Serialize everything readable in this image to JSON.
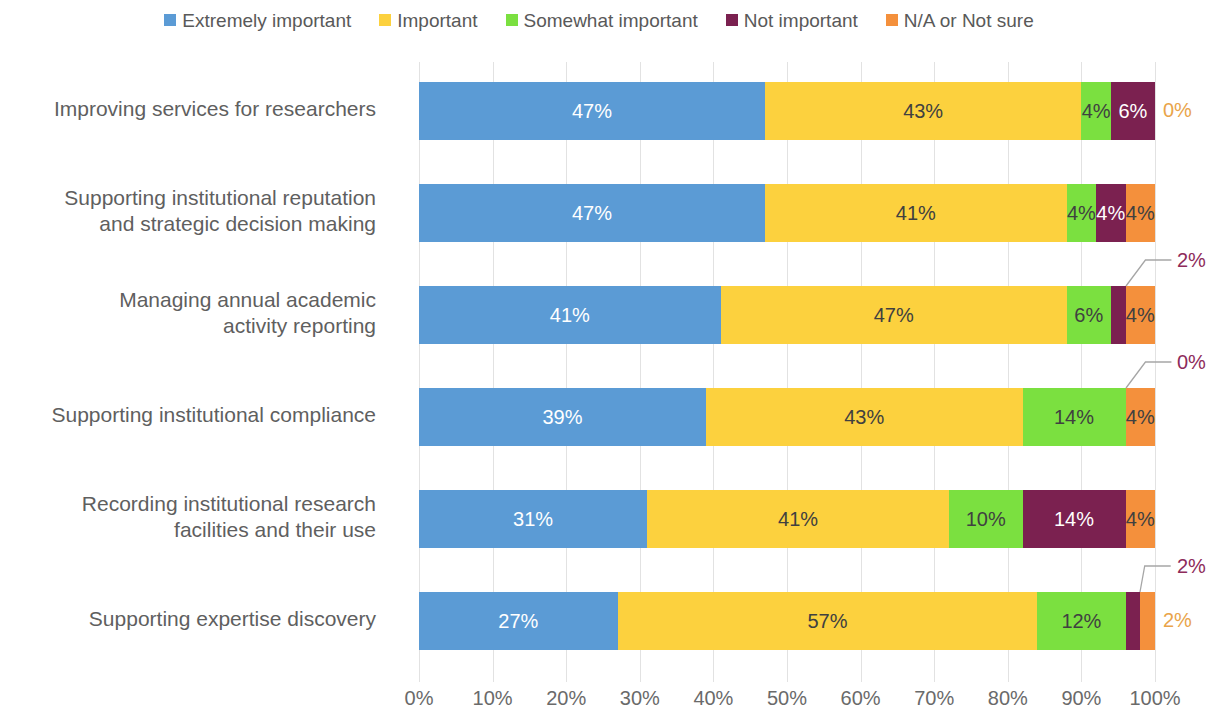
{
  "legend": {
    "items": [
      {
        "label": "Extremely important",
        "color": "#5B9BD5"
      },
      {
        "label": "Important",
        "color": "#FCD13E"
      },
      {
        "label": "Somewhat important",
        "color": "#7BE040"
      },
      {
        "label": "Not important",
        "color": "#7B2150"
      },
      {
        "label": "N/A or Not sure",
        "color": "#F4903C"
      }
    ]
  },
  "axis": {
    "ticks": [
      "0%",
      "10%",
      "20%",
      "30%",
      "40%",
      "50%",
      "60%",
      "70%",
      "80%",
      "90%",
      "100%"
    ]
  },
  "rows": [
    {
      "label_lines": [
        "Improving services for researchers"
      ],
      "segments": [
        {
          "value": 47,
          "label": "47%",
          "inside": true,
          "text_color": "light"
        },
        {
          "value": 43,
          "label": "43%",
          "inside": true,
          "text_color": "dark"
        },
        {
          "value": 4,
          "label": "4%",
          "inside": true,
          "text_color": "dark"
        },
        {
          "value": 6,
          "label": "6%",
          "inside": true,
          "text_color": "light"
        },
        {
          "value": 0,
          "label": "0%",
          "inside": false,
          "text_color": "orange",
          "callout": false
        }
      ]
    },
    {
      "label_lines": [
        "Supporting institutional reputation",
        "and strategic decision making"
      ],
      "segments": [
        {
          "value": 47,
          "label": "47%",
          "inside": true,
          "text_color": "light"
        },
        {
          "value": 41,
          "label": "41%",
          "inside": true,
          "text_color": "dark"
        },
        {
          "value": 4,
          "label": "4%",
          "inside": true,
          "text_color": "dark"
        },
        {
          "value": 4,
          "label": "4%",
          "inside": true,
          "text_color": "light"
        },
        {
          "value": 4,
          "label": "4%",
          "inside": true,
          "text_color": "dark"
        }
      ]
    },
    {
      "label_lines": [
        "Managing annual academic",
        "activity reporting"
      ],
      "segments": [
        {
          "value": 41,
          "label": "41%",
          "inside": true,
          "text_color": "light"
        },
        {
          "value": 47,
          "label": "47%",
          "inside": true,
          "text_color": "dark"
        },
        {
          "value": 6,
          "label": "6%",
          "inside": true,
          "text_color": "dark"
        },
        {
          "value": 2,
          "label": "2%",
          "inside": false,
          "text_color": "maroon",
          "callout": true
        },
        {
          "value": 4,
          "label": "4%",
          "inside": true,
          "text_color": "dark"
        }
      ]
    },
    {
      "label_lines": [
        "Supporting institutional compliance"
      ],
      "segments": [
        {
          "value": 39,
          "label": "39%",
          "inside": true,
          "text_color": "light"
        },
        {
          "value": 43,
          "label": "43%",
          "inside": true,
          "text_color": "dark"
        },
        {
          "value": 14,
          "label": "14%",
          "inside": true,
          "text_color": "dark"
        },
        {
          "value": 0,
          "label": "0%",
          "inside": false,
          "text_color": "maroon",
          "callout": true
        },
        {
          "value": 4,
          "label": "4%",
          "inside": true,
          "text_color": "dark"
        }
      ]
    },
    {
      "label_lines": [
        "Recording institutional research",
        "facilities and their use"
      ],
      "segments": [
        {
          "value": 31,
          "label": "31%",
          "inside": true,
          "text_color": "light"
        },
        {
          "value": 41,
          "label": "41%",
          "inside": true,
          "text_color": "dark"
        },
        {
          "value": 10,
          "label": "10%",
          "inside": true,
          "text_color": "dark"
        },
        {
          "value": 14,
          "label": "14%",
          "inside": true,
          "text_color": "light"
        },
        {
          "value": 4,
          "label": "4%",
          "inside": true,
          "text_color": "dark"
        }
      ]
    },
    {
      "label_lines": [
        "Supporting expertise discovery"
      ],
      "segments": [
        {
          "value": 27,
          "label": "27%",
          "inside": true,
          "text_color": "light"
        },
        {
          "value": 57,
          "label": "57%",
          "inside": true,
          "text_color": "dark"
        },
        {
          "value": 12,
          "label": "12%",
          "inside": true,
          "text_color": "dark"
        },
        {
          "value": 2,
          "label": "2%",
          "inside": false,
          "text_color": "maroon",
          "callout": true
        },
        {
          "value": 2,
          "label": "2%",
          "inside": false,
          "text_color": "orange",
          "callout": false
        }
      ]
    }
  ],
  "chart_data": {
    "type": "bar",
    "subtype": "100% stacked horizontal bar",
    "title": "",
    "xlabel": "",
    "ylabel": "",
    "xlim": [
      0,
      100
    ],
    "grid": true,
    "legend_position": "top",
    "categories": [
      "Improving services for researchers",
      "Supporting institutional reputation and strategic decision making",
      "Managing annual academic activity reporting",
      "Supporting institutional compliance",
      "Recording institutional research facilities and their use",
      "Supporting expertise discovery"
    ],
    "series": [
      {
        "name": "Extremely important",
        "values": [
          47,
          47,
          41,
          39,
          31,
          27
        ]
      },
      {
        "name": "Important",
        "values": [
          43,
          41,
          47,
          43,
          41,
          57
        ]
      },
      {
        "name": "Somewhat important",
        "values": [
          4,
          4,
          6,
          14,
          10,
          12
        ]
      },
      {
        "name": "Not important",
        "values": [
          6,
          4,
          2,
          0,
          14,
          2
        ]
      },
      {
        "name": "N/A or Not sure",
        "values": [
          0,
          4,
          4,
          4,
          4,
          2
        ]
      }
    ],
    "tick_labels": [
      "0%",
      "10%",
      "20%",
      "30%",
      "40%",
      "50%",
      "60%",
      "70%",
      "80%",
      "90%",
      "100%"
    ]
  }
}
